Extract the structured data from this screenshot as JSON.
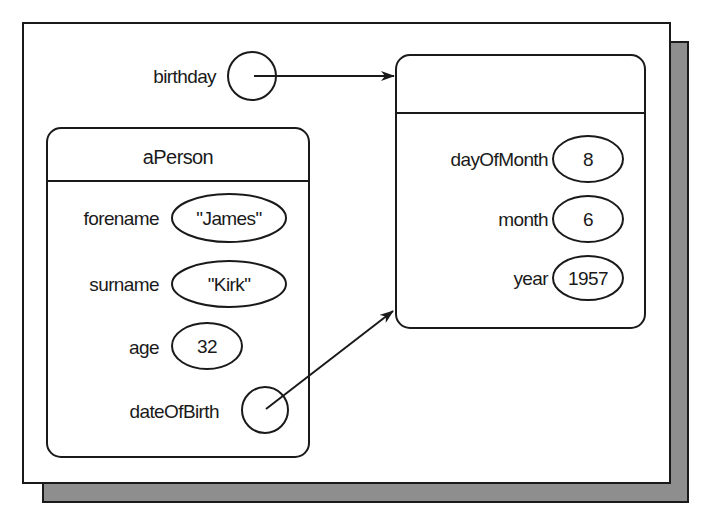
{
  "diagram": {
    "colors": {
      "line": "#1a1a1a",
      "frame_fill": "#ffffff",
      "shadow": "#8e8e8e"
    },
    "variable": {
      "name": "birthday"
    },
    "person_object": {
      "title": "aPerson",
      "fields": [
        {
          "name": "forename",
          "value": "\"James\""
        },
        {
          "name": "surname",
          "value": "\"Kirk\""
        },
        {
          "name": "age",
          "value": "32"
        },
        {
          "name": "dateOfBirth",
          "value": ""
        }
      ]
    },
    "date_object": {
      "title": "",
      "fields": [
        {
          "name": "dayOfMonth",
          "value": "8"
        },
        {
          "name": "month",
          "value": "6"
        },
        {
          "name": "year",
          "value": "1957"
        }
      ]
    },
    "references": [
      {
        "from": "birthday",
        "to": "date_object"
      },
      {
        "from": "aPerson.dateOfBirth",
        "to": "date_object"
      }
    ]
  }
}
